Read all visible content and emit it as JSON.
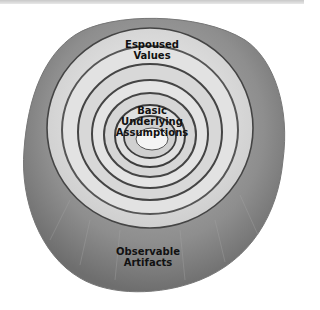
{
  "diagram": {
    "type": "onion layers",
    "layers": [
      {
        "name": "outer",
        "label": "Observable Artifacts"
      },
      {
        "name": "middle",
        "label": "Espoused Values"
      },
      {
        "name": "core",
        "label": "Basic Underlying Assumptions"
      }
    ],
    "labels": {
      "espoused_line1": "Espoused",
      "espoused_line2": "Values",
      "basic_line1": "Basic",
      "basic_line2": "Underlying",
      "basic_line3": "Assumptions",
      "artifacts_line1": "Observable",
      "artifacts_line2": "Artifacts"
    },
    "colors": {
      "outer_skin": "#8a8a8a",
      "ring_light": "#e6e6e6",
      "ring_dark": "#4a4a4a",
      "core": "#f4f4f4"
    }
  }
}
